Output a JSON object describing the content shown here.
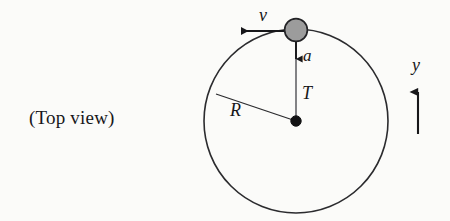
{
  "figure": {
    "caption": "(Top view)",
    "background_color": "#fbfbf9",
    "ink_color": "#17171a",
    "ball_fill_color": "#9c9c9c",
    "labels": {
      "velocity": "v",
      "acceleration": "a",
      "tension": "T",
      "radius": "R",
      "axis_y": "y"
    },
    "geometry": {
      "circle_center_x": 296,
      "circle_center_y": 121,
      "circle_radius": 92,
      "ball_center_x": 296,
      "ball_center_y": 30,
      "ball_radius": 11.5,
      "hub_radius": 5,
      "velocity_arrow_from_x": 296,
      "velocity_arrow_to_x": 236,
      "velocity_arrow_y": 31,
      "accel_arrow_from_y": 41,
      "accel_arrow_to_y": 64,
      "accel_arrow_x": 296,
      "radius_line_end_x": 216,
      "radius_line_end_y": 94,
      "axis_arrow_x": 418,
      "axis_arrow_from_y": 134,
      "axis_arrow_to_y": 84
    }
  }
}
